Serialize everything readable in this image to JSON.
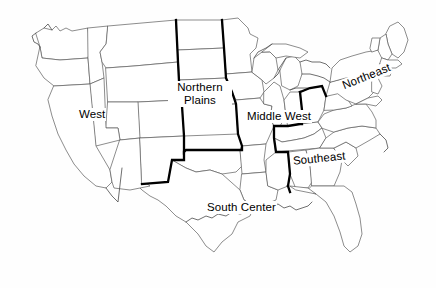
{
  "map": {
    "title": "United States Regional Map",
    "background_color": "#fefefe",
    "state_border_color": "#5c5c5c",
    "region_border_color": "#000000",
    "label_color": "#000000",
    "regions": [
      {
        "id": "west",
        "label": "West",
        "label_lines": [
          "West"
        ]
      },
      {
        "id": "northern-plains",
        "label": "Northern Plains",
        "label_lines": [
          "Northern",
          "Plains"
        ]
      },
      {
        "id": "middle-west",
        "label": "Middle West",
        "label_lines": [
          "Middle West"
        ]
      },
      {
        "id": "northeast",
        "label": "Northeast",
        "label_lines": [
          "Northeast"
        ]
      },
      {
        "id": "southeast",
        "label": "Southeast",
        "label_lines": [
          "Southeast"
        ]
      },
      {
        "id": "south-center",
        "label": "South Center",
        "label_lines": [
          "South Center"
        ]
      }
    ],
    "labels": {
      "west": "West",
      "northern_plains_line1": "Northern",
      "northern_plains_line2": "Plains",
      "middle_west": "Middle West",
      "northeast": "Northeast",
      "southeast": "Southeast",
      "south_center": "South Center"
    }
  }
}
